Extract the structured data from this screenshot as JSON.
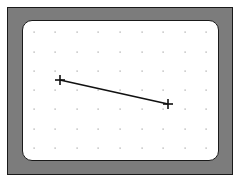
{
  "display": {
    "bezel_color": "#7c7c7c",
    "screen_color": "#ffffff",
    "grid": {
      "x": [
        34,
        55,
        77,
        98,
        120,
        142,
        163,
        185,
        206
      ],
      "y": [
        32,
        52,
        71,
        90,
        109,
        129,
        148
      ],
      "dot_color": "#a0a0a0"
    },
    "line": {
      "start": {
        "x": 60,
        "y": 80
      },
      "end": {
        "x": 168,
        "y": 104
      },
      "color": "#111111"
    },
    "markers": [
      {
        "name": "start-point",
        "x": 60,
        "y": 80
      },
      {
        "name": "end-point",
        "x": 168,
        "y": 104
      }
    ]
  }
}
